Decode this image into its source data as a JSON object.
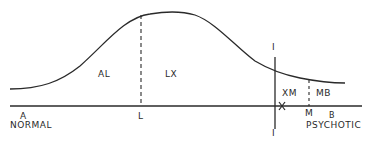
{
  "diagram": {
    "type": "distribution-curve",
    "colors": {
      "ink": "#2a2a2a",
      "background": "#ffffff"
    },
    "axis": {
      "left_end": "A",
      "left_caption": "NORMAL",
      "right_end": "B",
      "right_caption": "PSYCHOTIC"
    },
    "points": {
      "L": "L",
      "X": "X",
      "M": "M"
    },
    "regions": {
      "AL": "AL",
      "LX": "LX",
      "XM": "XM",
      "MB": "MB"
    },
    "cutoff_line": {
      "top_label": "I",
      "bottom_label": "I"
    }
  }
}
